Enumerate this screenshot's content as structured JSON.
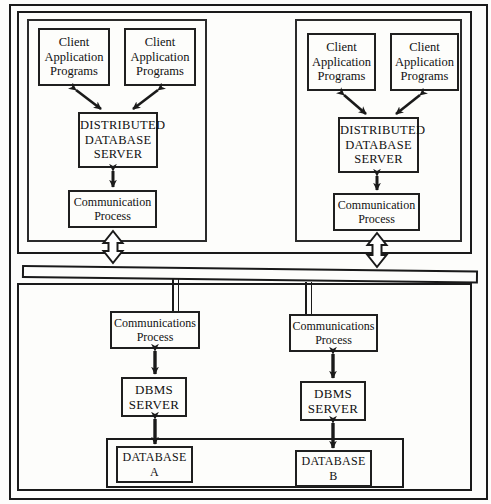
{
  "diagram": {
    "colors": {
      "line": "#1a1a1a",
      "background": "#fdfdfb",
      "text": "#111111"
    },
    "top_left_site": {
      "clients": [
        {
          "lines": [
            "Client",
            "Application",
            "Programs"
          ]
        },
        {
          "lines": [
            "Client",
            "Application",
            "Programs"
          ]
        }
      ],
      "server": {
        "lines": [
          "DISTRIBUTED",
          "DATABASE",
          "SERVER"
        ]
      },
      "comm": {
        "lines": [
          "Communication",
          "Process"
        ]
      }
    },
    "top_right_site": {
      "clients": [
        {
          "lines": [
            "Client",
            "Application",
            "Programs"
          ]
        },
        {
          "lines": [
            "Client",
            "Application",
            "Programs"
          ]
        }
      ],
      "server": {
        "lines": [
          "DISTRIBUTED",
          "DATABASE",
          "SERVER"
        ]
      },
      "comm": {
        "lines": [
          "Communication",
          "Process"
        ]
      }
    },
    "network": {
      "label": ""
    },
    "bottom_left_site": {
      "comm": {
        "lines": [
          "Communications",
          "Process"
        ]
      },
      "dbms": {
        "lines": [
          "DBMS",
          "SERVER"
        ]
      },
      "database": {
        "lines": [
          "DATABASE",
          "A"
        ]
      }
    },
    "bottom_right_site": {
      "comm": {
        "lines": [
          "Communications",
          "Process"
        ]
      },
      "dbms": {
        "lines": [
          "DBMS",
          "SERVER"
        ]
      },
      "database": {
        "lines": [
          "DATABASE",
          "B"
        ]
      }
    }
  }
}
